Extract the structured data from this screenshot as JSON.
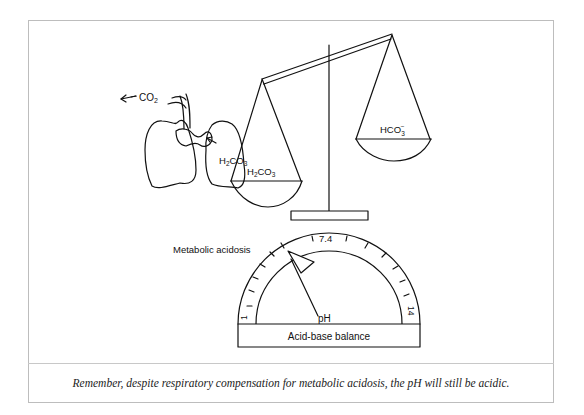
{
  "figure": {
    "lungs": {
      "co2_label": "CO",
      "co2_sub": "2",
      "h2co3_label_parts": [
        "H",
        "2",
        "CO",
        "3"
      ]
    },
    "scale": {
      "left_pan_label_parts": [
        "H",
        "2",
        "CO",
        "3"
      ],
      "right_pan_label_parts": [
        "HCO",
        "3",
        "−"
      ]
    },
    "gauge": {
      "title": "Metabolic acidosis",
      "min_label": "1",
      "max_label": "14",
      "mid_label": "7.4",
      "pointer_label": "pH",
      "base_label": "Acid-base balance"
    }
  },
  "caption": "Remember, despite respiratory compensation for metabolic acidosis, the pH will still be acidic.",
  "colors": {
    "ink": "#111111",
    "frame": "#bdbdbd"
  }
}
